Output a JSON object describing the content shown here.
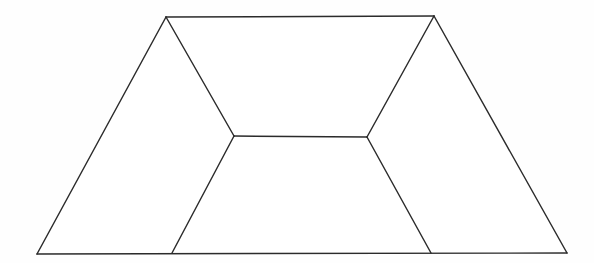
{
  "figure": {
    "kind": "line-drawing",
    "canvas": {
      "width": 594,
      "height": 263,
      "background_color": "#fefefe"
    },
    "style": {
      "stroke_color": "#2b2b2b",
      "stroke_width": 1.45,
      "fill_color": "#ffffff"
    },
    "vertices": {
      "top_left_apex": {
        "name": "A",
        "x": 166,
        "y": 17
      },
      "top_right_apex": {
        "name": "B",
        "x": 434,
        "y": 16
      },
      "bottom_right_corner": {
        "name": "C",
        "x": 567,
        "y": 253
      },
      "bottom_left_corner": {
        "name": "D",
        "x": 37,
        "y": 254
      },
      "bottom_inner_left": {
        "name": "E",
        "x": 172,
        "y": 253
      },
      "bottom_inner_right": {
        "name": "F",
        "x": 431,
        "y": 253
      },
      "center_left": {
        "name": "G",
        "x": 234,
        "y": 136
      },
      "center_right": {
        "name": "H",
        "x": 367,
        "y": 137
      }
    },
    "edges": [
      {
        "id": "top-edge",
        "from": "top_left_apex",
        "to": "top_right_apex",
        "points": "166,17 434,16"
      },
      {
        "id": "right-outer-edge",
        "from": "top_right_apex",
        "to": "bottom_right_corner",
        "points": "434,16 567,253"
      },
      {
        "id": "bottom-edge",
        "from": "bottom_right_corner",
        "to": "bottom_left_corner",
        "points": "567,253 37,254"
      },
      {
        "id": "left-outer-edge",
        "from": "bottom_left_corner",
        "to": "top_left_apex",
        "points": "37,254 166,17"
      },
      {
        "id": "left-upper-inner-edge",
        "from": "top_left_apex",
        "to": "center_left",
        "points": "166,17 234,136"
      },
      {
        "id": "left-lower-inner-edge",
        "from": "center_left",
        "to": "bottom_inner_left",
        "points": "234,136 172,253"
      },
      {
        "id": "right-upper-inner-edge",
        "from": "top_right_apex",
        "to": "center_right",
        "points": "434,16 367,137"
      },
      {
        "id": "right-lower-inner-edge",
        "from": "center_right",
        "to": "bottom_inner_right",
        "points": "367,137 431,253"
      },
      {
        "id": "center-horizontal-edge",
        "from": "center_left",
        "to": "center_right",
        "points": "234,136 367,137"
      }
    ],
    "faces": [
      {
        "id": "left-face",
        "label": "left region",
        "polygon": "166,17 234,136 172,253 37,254"
      },
      {
        "id": "center-face",
        "label": "center region",
        "polygon": "166,17 434,16 367,137 234,136"
      },
      {
        "id": "right-face",
        "label": "right region",
        "polygon": "434,16 567,253 431,253 367,137"
      },
      {
        "id": "bottom-face",
        "label": "bottom region",
        "polygon": "234,136 367,137 431,253 172,253"
      }
    ]
  }
}
